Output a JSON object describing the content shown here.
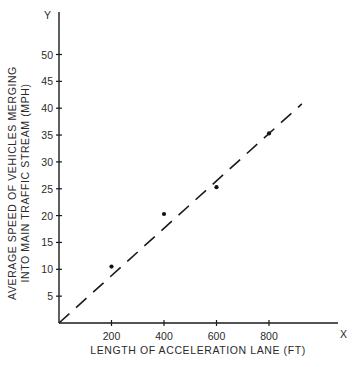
{
  "chart_data": {
    "type": "scatter",
    "title": "",
    "xlabel": "LENGTH OF ACCELERATION LANE (FT)",
    "ylabel_line1": "AVERAGE SPEED OF VEHICLES MERGING",
    "ylabel_line2": "INTO MAIN TRAFFIC STREAM (MPH)",
    "x_axis_end_label": "X",
    "y_axis_end_label": "Y",
    "x_ticks": [
      "200",
      "400",
      "600",
      "800"
    ],
    "y_ticks": [
      "5",
      "10",
      "15",
      "20",
      "25",
      "30",
      "35",
      "40",
      "45",
      "50"
    ],
    "xlim": [
      0,
      1080
    ],
    "ylim": [
      0,
      55
    ],
    "grid": false,
    "series": [
      {
        "name": "observed",
        "style": "points",
        "x": [
          200,
          400,
          600,
          800
        ],
        "y": [
          10.5,
          20.3,
          25.3,
          35.3
        ]
      },
      {
        "name": "fitted line",
        "style": "dashed",
        "x": [
          0,
          925
        ],
        "y": [
          0,
          40.8
        ]
      }
    ]
  }
}
